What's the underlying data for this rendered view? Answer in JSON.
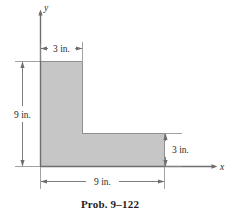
{
  "figure": {
    "caption": "Prob. 9–122",
    "axes": {
      "x_label": "x",
      "y_label": "y"
    },
    "dimensions": {
      "top_width": "3 in.",
      "left_height": "9 in.",
      "right_height": "3 in.",
      "bottom_width": "9 in."
    },
    "colors": {
      "fill": "#c6c6c6",
      "outline": "#8a8a8a",
      "line": "#6e6e6e",
      "text": "#2b2b2b",
      "caption": "#1c1c1c",
      "background": "#ffffff"
    },
    "shape": {
      "name": "L-shaped cross section",
      "vertices": "(0,0) (9,0) (9,3) (3,3) (3,9) (0,9)"
    }
  }
}
